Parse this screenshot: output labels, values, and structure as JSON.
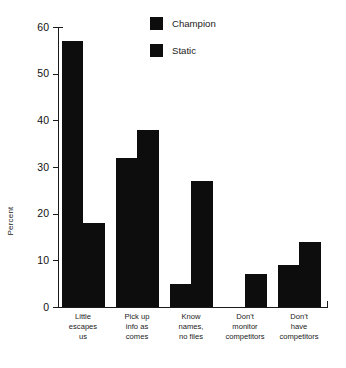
{
  "chart_data": {
    "type": "bar",
    "title": "",
    "xlabel": "",
    "ylabel": "Percent",
    "ylim": [
      0,
      60
    ],
    "yticks": [
      0,
      10,
      20,
      30,
      40,
      50,
      60
    ],
    "grid": false,
    "legend_position": "top-center",
    "categories": [
      "Little\nescapes\nus",
      "Pick up\ninfo as\ncomes",
      "Know\nnames,\nno files",
      "Don't\nmonitor\ncompetitors",
      "Don't\nhave\ncompetitors"
    ],
    "series": [
      {
        "name": "Champion",
        "color": "#0d0d0d",
        "values": [
          57,
          32,
          5,
          0,
          9
        ]
      },
      {
        "name": "Static",
        "color": "#0d0d0d",
        "values": [
          18,
          38,
          27,
          7,
          14
        ]
      }
    ]
  }
}
